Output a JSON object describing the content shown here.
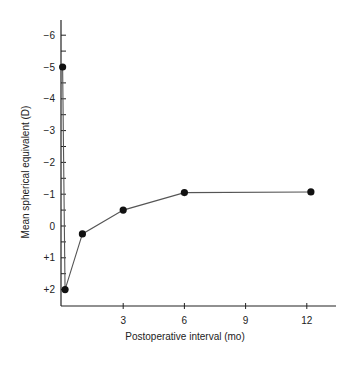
{
  "chart_data": {
    "type": "line",
    "title": "",
    "xlabel": "Postoperative interval (mo)",
    "ylabel": "Mean spherical equivalent (D)",
    "x_ticks": [
      3,
      6,
      9,
      12
    ],
    "x_tick_labels": [
      "3",
      "6",
      "9",
      "12"
    ],
    "y_ticks": [
      -6,
      -5,
      -4,
      -3,
      -2,
      -1,
      0,
      1,
      2
    ],
    "y_tick_labels": [
      "−6",
      "−5",
      "−4",
      "−3",
      "−2",
      "−1",
      "0",
      "+1",
      "+2"
    ],
    "y_inverted": true,
    "xlim": [
      0,
      13
    ],
    "ylim": [
      2.5,
      -6.5
    ],
    "grid": false,
    "legend": null,
    "series": [
      {
        "name": "Mean spherical equivalent",
        "x": [
          0.03,
          0.15,
          1,
          3,
          6,
          12.2
        ],
        "y": [
          -5,
          2,
          0.25,
          -0.5,
          -1.05,
          -1.07
        ]
      }
    ],
    "colors": {
      "line": "#555555",
      "marker": "#111111",
      "axis": "#222222"
    }
  }
}
